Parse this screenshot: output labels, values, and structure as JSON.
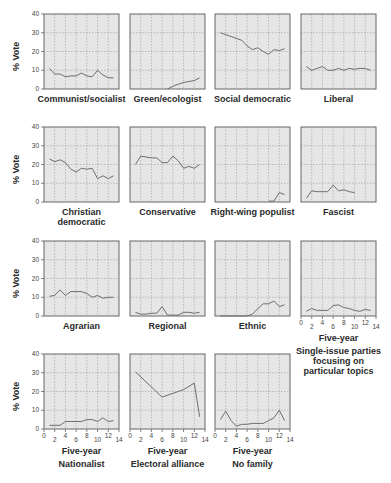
{
  "chart_data": {
    "type": "line",
    "layout": "small-multiples grid 4x4 (15 panels)",
    "ylabel": "% Vote",
    "xlabel": "Five-year",
    "ylim": [
      0,
      40
    ],
    "xlim": [
      0,
      14
    ],
    "yticks": [
      0,
      10,
      20,
      30,
      40
    ],
    "xticks": [
      0,
      2,
      4,
      6,
      8,
      10,
      12,
      14
    ],
    "grid": true,
    "panels": [
      {
        "title": "Communist/socialist",
        "x": [
          1,
          2,
          3,
          4,
          5,
          6,
          7,
          8,
          9,
          10,
          11,
          12,
          13
        ],
        "values": [
          11,
          8,
          8,
          6.5,
          7,
          7,
          8.5,
          7,
          6.5,
          10,
          7.5,
          6,
          6
        ]
      },
      {
        "title": "Green/ecologist",
        "x": [
          7,
          8,
          9,
          10,
          11,
          12,
          13
        ],
        "values": [
          0,
          1.5,
          2.5,
          3.5,
          4,
          4.5,
          6
        ]
      },
      {
        "title": "Social democratic",
        "x": [
          1,
          2,
          3,
          4,
          5,
          6,
          7,
          8,
          9,
          10,
          11,
          12,
          13
        ],
        "values": [
          30,
          29,
          28,
          27,
          26,
          23,
          21,
          22,
          20,
          18.5,
          21,
          20.5,
          21.5
        ]
      },
      {
        "title": "Liberal",
        "x": [
          1,
          2,
          3,
          4,
          5,
          6,
          7,
          8,
          9,
          10,
          11,
          12,
          13
        ],
        "values": [
          12,
          10,
          11,
          12,
          10,
          10,
          11,
          10,
          11,
          10.5,
          11,
          11,
          10
        ]
      },
      {
        "title": "Christian democratic",
        "x": [
          1,
          2,
          3,
          4,
          5,
          6,
          7,
          8,
          9,
          10,
          11,
          12,
          13
        ],
        "values": [
          23,
          21.5,
          22.5,
          21,
          17.5,
          16,
          18,
          17.5,
          18,
          12.5,
          14,
          12.5,
          14
        ]
      },
      {
        "title": "Conservative",
        "x": [
          1,
          2,
          3,
          4,
          5,
          6,
          7,
          8,
          9,
          10,
          11,
          12,
          13
        ],
        "values": [
          20,
          24.5,
          24,
          23.5,
          23.5,
          21,
          21,
          24.5,
          22,
          18,
          19,
          18,
          20
        ]
      },
      {
        "title": "Right-wing populist",
        "x": [
          10,
          11,
          12,
          13
        ],
        "values": [
          0.5,
          0.5,
          5,
          4
        ]
      },
      {
        "title": "Fascist",
        "x": [
          1,
          2,
          3,
          4,
          5,
          6,
          7,
          8,
          9,
          10
        ],
        "values": [
          2,
          6,
          5.5,
          5.5,
          5.5,
          9,
          6,
          6.5,
          5.5,
          5
        ]
      },
      {
        "title": "Agrarian",
        "x": [
          1,
          2,
          3,
          4,
          5,
          6,
          7,
          8,
          9,
          10,
          11,
          12,
          13
        ],
        "values": [
          10.5,
          11,
          14,
          11,
          13,
          13,
          13,
          12,
          10,
          11,
          9.5,
          10,
          10
        ]
      },
      {
        "title": "Regional",
        "x": [
          1,
          2,
          3,
          4,
          5,
          6,
          7,
          8,
          9,
          10,
          11,
          12,
          13
        ],
        "values": [
          2,
          1,
          1,
          1.5,
          1.5,
          5,
          0.5,
          0.5,
          0.5,
          2,
          2,
          1.5,
          2
        ]
      },
      {
        "title": "Ethnic",
        "x": [
          1,
          2,
          3,
          4,
          5,
          6,
          7,
          8,
          9,
          10,
          11,
          12,
          13
        ],
        "values": [
          0,
          0,
          0,
          0,
          0,
          0,
          1,
          4,
          6.5,
          6.5,
          8,
          5,
          6
        ]
      },
      {
        "title": "Single-issue parties focusing on particular topics",
        "x": [
          1,
          2,
          3,
          4,
          5,
          6,
          7,
          8,
          9,
          10,
          11,
          12,
          13
        ],
        "values": [
          2.5,
          4,
          3,
          3,
          3,
          5.5,
          6,
          4.5,
          4,
          3,
          2.5,
          3.5,
          3
        ]
      },
      {
        "title": "Nationalist",
        "x": [
          1,
          2,
          3,
          4,
          5,
          6,
          7,
          8,
          9,
          10,
          11,
          12,
          13
        ],
        "values": [
          2,
          2,
          2,
          4,
          4,
          4,
          4,
          5,
          5,
          4,
          6,
          4,
          4.5
        ]
      },
      {
        "title": "Electoral alliance",
        "x": [
          1,
          6,
          10,
          12,
          13
        ],
        "values": [
          30.5,
          17,
          21,
          24.5,
          6.5
        ]
      },
      {
        "title": "No family",
        "x": [
          1,
          2,
          3,
          4,
          5,
          6,
          7,
          8,
          9,
          10,
          11,
          12,
          13
        ],
        "values": [
          5,
          9.5,
          4.5,
          1.5,
          2.5,
          2.5,
          3,
          3,
          3,
          4.5,
          6,
          10,
          4.5
        ]
      }
    ]
  },
  "labels": {
    "ylabel": "% Vote",
    "xlabel": "Five-year",
    "ytick_labels": [
      "0",
      "10",
      "20",
      "30",
      "40"
    ],
    "xtick_labels": [
      "0",
      "2",
      "4",
      "6",
      "8",
      "10",
      "12",
      "14"
    ]
  },
  "colors": {
    "plot_bg": "#e6e6e6",
    "frame": "#666666",
    "grid": "#9a9a9a",
    "line": "#6e6e6e"
  }
}
